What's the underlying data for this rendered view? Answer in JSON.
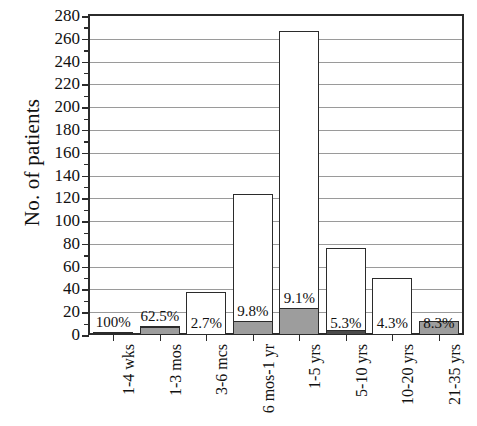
{
  "chart_data": {
    "type": "bar",
    "title": "",
    "xlabel": "",
    "ylabel": "No. of patients",
    "ylim": [
      0,
      280
    ],
    "ytick_step": 20,
    "yticks": [
      0,
      20,
      40,
      60,
      80,
      100,
      120,
      140,
      160,
      180,
      200,
      220,
      240,
      260,
      280
    ],
    "grid": true,
    "legend": "none",
    "categories": [
      "1-4 wks",
      "1-3 mos",
      "3-6 mcs",
      "6 mos-1 yr",
      "1-5 yrs",
      "5-10 yrs",
      "10-20 yrs",
      "21-35 yrs"
    ],
    "series": [
      {
        "name": "Total patients",
        "values": [
          2,
          8,
          38,
          124,
          267,
          76,
          50,
          12
        ]
      },
      {
        "name": "Shaded subgroup",
        "values": [
          2,
          7,
          0,
          12,
          24,
          4,
          0,
          12
        ]
      }
    ],
    "data_labels": [
      "100%",
      "62.5%",
      "2.7%",
      "9.8%",
      "9.1%",
      "5.3%",
      "4.3%",
      "8.3%"
    ],
    "label_positions": [
      "above",
      "above",
      "inside",
      "above-shade",
      "above-shade",
      "inside",
      "inside",
      "inside"
    ]
  },
  "axis": {
    "y_title": "No. of patients"
  }
}
